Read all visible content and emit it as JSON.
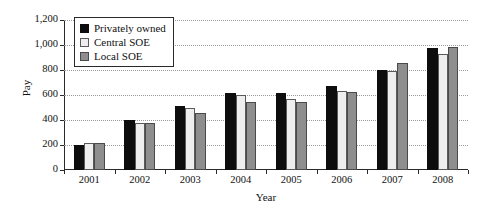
{
  "chart_data": {
    "type": "bar",
    "title": "",
    "xlabel": "Year",
    "ylabel": "Pay",
    "categories": [
      "2001",
      "2002",
      "2003",
      "2004",
      "2005",
      "2006",
      "2007",
      "2008"
    ],
    "series": [
      {
        "name": "Privately owned",
        "color": "#0d0d0d",
        "values": [
          200,
          400,
          510,
          620,
          620,
          670,
          800,
          980
        ]
      },
      {
        "name": "Central SOE",
        "color": "#eeeeee",
        "values": [
          220,
          375,
          495,
          600,
          570,
          630,
          790,
          925
        ]
      },
      {
        "name": "Local SOE",
        "color": "#8e8e8e",
        "values": [
          220,
          380,
          460,
          545,
          545,
          625,
          860,
          985
        ]
      }
    ],
    "ylim": [
      0,
      1200
    ],
    "yticks": [
      0,
      200,
      400,
      600,
      800,
      1000,
      1200
    ],
    "ytick_labels": [
      "0",
      "200",
      "400",
      "600",
      "800",
      "1,000",
      "1,200"
    ],
    "grid": true,
    "grid_axis": "y",
    "grid_style": "dotted",
    "legend_position": "top-left-inside",
    "legend_entries": [
      "Privately owned",
      "Central SOE",
      "Local SOE"
    ]
  }
}
